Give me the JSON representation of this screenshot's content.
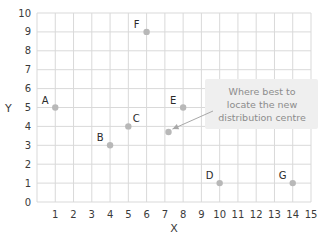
{
  "chart_data": {
    "type": "scatter",
    "title": "",
    "xlabel": "X",
    "ylabel": "Y",
    "xlim": [
      0,
      15
    ],
    "ylim": [
      0,
      10
    ],
    "grid": true,
    "x_ticks": [
      1,
      2,
      3,
      4,
      5,
      6,
      7,
      8,
      9,
      10,
      11,
      12,
      13,
      14,
      15
    ],
    "y_ticks": [
      0,
      1,
      2,
      3,
      4,
      5,
      6,
      7,
      8,
      9,
      10
    ],
    "points": [
      {
        "label": "A",
        "x": 1,
        "y": 5
      },
      {
        "label": "B",
        "x": 4,
        "y": 3
      },
      {
        "label": "C",
        "x": 5,
        "y": 4
      },
      {
        "label": "D",
        "x": 10,
        "y": 1
      },
      {
        "label": "E",
        "x": 8,
        "y": 5
      },
      {
        "label": "F",
        "x": 6,
        "y": 9
      },
      {
        "label": "G",
        "x": 14,
        "y": 1
      }
    ],
    "highlight_point": {
      "x": 7.2,
      "y": 3.7
    },
    "annotation": {
      "lines": [
        "Where best to",
        "locate the new",
        "distribution centre"
      ],
      "text": "Where best to locate the new distribution centre"
    },
    "colors": {
      "grid": "#d9d9d9",
      "point": "#b8b8b8",
      "callout_bg": "#efefef",
      "callout_text": "#8c8c8c"
    }
  }
}
